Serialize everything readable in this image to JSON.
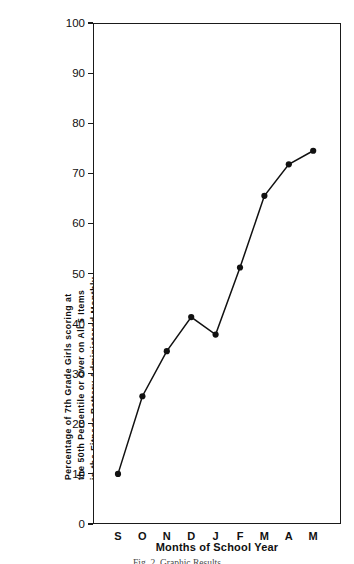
{
  "chart_data": {
    "type": "line",
    "title": "",
    "categories": [
      "S",
      "O",
      "N",
      "D",
      "J",
      "F",
      "M",
      "A",
      "M"
    ],
    "values": [
      10.0,
      25.5,
      34.5,
      41.3,
      37.8,
      51.2,
      65.5,
      71.8,
      74.5
    ],
    "xlabel": "Months of School Year",
    "ylabel": "Percentage of 7th Grade Girls scoring at the 50th Percentile or Over on All 5 Items in the Fitness Battery Administered Monthly",
    "ylabel_lines": [
      "Percentage of 7th Grade Girls scoring at",
      "the 50th Percentile or Over on All 5 Items",
      "in the Fitness Battery Administered Monthly"
    ],
    "ylim": [
      0,
      100
    ],
    "yticks": [
      0,
      10,
      20,
      30,
      40,
      50,
      60,
      70,
      80,
      90,
      100
    ],
    "ytick_labels": [
      "0",
      "10",
      "20",
      "30",
      "40",
      "50",
      "60",
      "70",
      "80",
      "90",
      "100"
    ],
    "grid": false,
    "legend": null,
    "marker": "filled-circle",
    "line_color": "#111111",
    "marker_color": "#111111",
    "axis_color": "#1a1a1a",
    "background": "#ffffff"
  },
  "caption": {
    "text": "Fig. 2. Graphic Results"
  }
}
